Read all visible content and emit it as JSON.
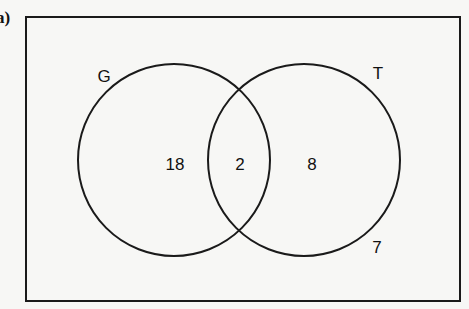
{
  "part_label": "a)",
  "venn": {
    "universe": {
      "x": 26,
      "y": 17,
      "width": 434,
      "height": 284
    },
    "sets": [
      {
        "name": "G",
        "cx": 174,
        "cy": 160,
        "r": 96,
        "label_x": 104,
        "label_y": 82
      },
      {
        "name": "T",
        "cx": 304,
        "cy": 160,
        "r": 96,
        "label_x": 378,
        "label_y": 79
      }
    ],
    "regions": [
      {
        "region": "G only",
        "value": "18",
        "x": 175,
        "y": 164
      },
      {
        "region": "G and T",
        "value": "2",
        "x": 240,
        "y": 164
      },
      {
        "region": "T only",
        "value": "8",
        "x": 312,
        "y": 164
      },
      {
        "region": "neither",
        "value": "7",
        "x": 377,
        "y": 247
      }
    ]
  },
  "colors": {
    "stroke": "#1a1a1a",
    "text": "#111111",
    "background": "#f7f7f5"
  }
}
